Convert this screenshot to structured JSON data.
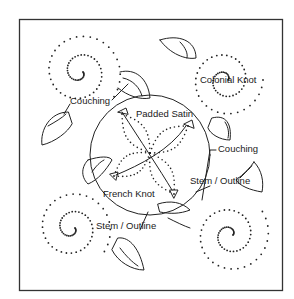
{
  "diagram": {
    "type": "embroidery-stitch-pattern",
    "frame": {
      "x": 19,
      "y": 19,
      "width": 263,
      "height": 271,
      "stroke": "#333333"
    },
    "colors": {
      "ink": "#222222",
      "background": "#ffffff"
    },
    "labels": [
      {
        "id": "couching-1",
        "text": "Couching",
        "x": 70,
        "y": 104
      },
      {
        "id": "colonial-knot",
        "text": "Colonial Knot",
        "x": 200,
        "y": 83
      },
      {
        "id": "padded-satin",
        "text": "Padded Satin",
        "x": 136,
        "y": 117
      },
      {
        "id": "couching-2",
        "text": "Couching",
        "x": 218,
        "y": 152
      },
      {
        "id": "french-knot",
        "text": "French Knot",
        "x": 103,
        "y": 197
      },
      {
        "id": "stem-outline-1",
        "text": "Stem / Outline",
        "x": 190,
        "y": 184
      },
      {
        "id": "stem-outline-2",
        "text": "Stem / Outline",
        "x": 96,
        "y": 229
      }
    ]
  }
}
